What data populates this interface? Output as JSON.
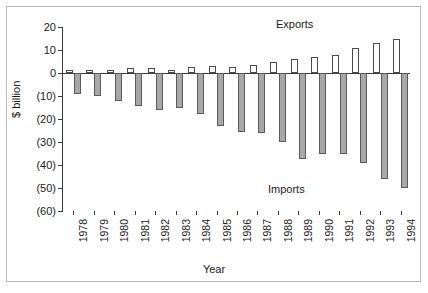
{
  "chart_data": {
    "type": "bar",
    "title": "",
    "xlabel": "Year",
    "ylabel": "$ billion",
    "ylim": [
      -60,
      20
    ],
    "ytick_values": [
      20,
      10,
      0,
      -10,
      -20,
      -30,
      -40,
      -50,
      -60
    ],
    "ytick_labels": [
      "20",
      "10",
      "0",
      "(10)",
      "(20)",
      "(30)",
      "(40)",
      "(50)",
      "(60)"
    ],
    "grid": false,
    "legend_position": "inline-annotations",
    "categories": [
      "1978",
      "1979",
      "1980",
      "1981",
      "1982",
      "1983",
      "1984",
      "1985",
      "1986",
      "1987",
      "1988",
      "1989",
      "1990",
      "1991",
      "1992",
      "1993",
      "1994"
    ],
    "series": [
      {
        "name": "Exports",
        "color": "#ffffff",
        "edge_color": "#4a4a4a",
        "values": [
          1.5,
          1.5,
          1.5,
          2.0,
          2.0,
          1.5,
          2.5,
          3.0,
          2.5,
          3.5,
          5.0,
          6.0,
          7.0,
          8.0,
          11.0,
          13.0,
          15.0
        ]
      },
      {
        "name": "Imports",
        "color": "#a8a8a8",
        "edge_color": "#5a5a5a",
        "values": [
          -9.0,
          -10.0,
          -12.0,
          -14.5,
          -16.0,
          -15.0,
          -18.0,
          -23.0,
          -25.5,
          -26.0,
          -30.0,
          -37.5,
          -35.0,
          -35.0,
          -39.0,
          -46.0,
          -50.0
        ]
      }
    ],
    "annotations": [
      {
        "name": "exports-note",
        "text": "Exports"
      },
      {
        "name": "imports-note",
        "text": "Imports"
      }
    ]
  }
}
